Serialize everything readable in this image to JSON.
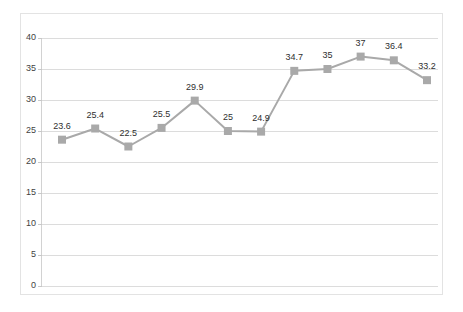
{
  "chart_data": {
    "type": "line",
    "title": "",
    "subtitle": "",
    "xlabel": "",
    "ylabel": "",
    "ylim": [
      0,
      40
    ],
    "y_ticks": [
      "0",
      "5",
      "10",
      "15",
      "20",
      "25",
      "30",
      "35",
      "40"
    ],
    "y_tick_values": [
      0,
      5,
      10,
      15,
      20,
      25,
      30,
      35,
      40
    ],
    "grid": true,
    "x_tick_labels": [],
    "legend": [],
    "legend_position": "none",
    "marker": "square",
    "series": [
      {
        "name": "",
        "color": "#a9a9a9",
        "values": [
          23.6,
          25.4,
          22.5,
          25.5,
          29.9,
          25,
          24.9,
          34.7,
          35,
          37,
          36.4,
          33.2
        ],
        "data_labels": [
          "23.6",
          "25.4",
          "22.5",
          "25.5",
          "29.9",
          "25",
          "24.9",
          "34.7",
          "35",
          "37",
          "36.4",
          "33.2"
        ]
      }
    ]
  },
  "style": {
    "line_color": "#a9a9a9",
    "marker_color": "#a9a9a9",
    "gridline_color": "#dcdcdc",
    "axis_color": "#d2d2d2",
    "frame_color": "#e3e3e3",
    "label_color": "#2f2f2f",
    "tick_label_color": "#3f3f3f",
    "background": "#ffffff"
  }
}
